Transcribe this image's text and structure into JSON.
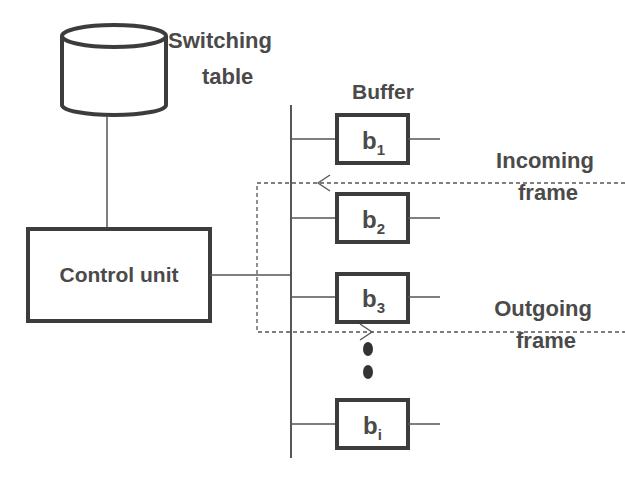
{
  "diagram": {
    "switching_table": {
      "line1": "Switching",
      "line2": "table"
    },
    "control_unit": {
      "label": "Control unit"
    },
    "buffer_title": "Buffer",
    "buffers": [
      {
        "base": "b",
        "sub": "1"
      },
      {
        "base": "b",
        "sub": "2"
      },
      {
        "base": "b",
        "sub": "3"
      },
      {
        "base": "b",
        "sub": "i"
      }
    ],
    "incoming": {
      "line1": "Incoming",
      "line2": "frame"
    },
    "outgoing": {
      "line1": "Outgoing",
      "line2": "frame"
    },
    "colors": {
      "stroke": "#3c3c3c",
      "text": "#4a4a4a",
      "background": "#ffffff"
    }
  }
}
